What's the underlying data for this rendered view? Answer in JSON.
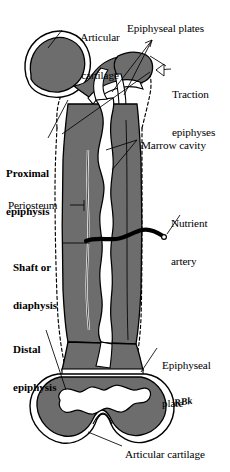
{
  "figure": {
    "signature": "RBk",
    "colors": {
      "bone_fill": "#6e6e6e",
      "cortex_gray": "#6d6d6d",
      "marrow_white": "#ffffff",
      "outline_black": "#000000",
      "periosteum_dashed": "#000000",
      "background": "#ffffff",
      "artery_black": "#000000"
    }
  },
  "labels": {
    "articular_cartilage_top": {
      "line1": "Articular",
      "line2": "cartilage"
    },
    "epiphyseal_plates": {
      "text": "Epiphyseal plates"
    },
    "traction_epiphyses": {
      "line1": "Traction",
      "line2": "epiphyses"
    },
    "proximal_epiphysis": {
      "line1": "Proximal",
      "line2": "epiphysis"
    },
    "marrow_cavity": {
      "text": "Marrow cavity"
    },
    "periosteum": {
      "text": "Periosteum"
    },
    "nutrient_artery": {
      "line1": "Nutrient",
      "line2": "artery"
    },
    "shaft_or_diaphysis": {
      "line1": "Shaft or",
      "line2": "diaphysis"
    },
    "distal_epiphysis": {
      "line1": "Distal",
      "line2": "epiphysis"
    },
    "epiphyseal_plate": {
      "line1": "Epiphyseal",
      "line2": "plate"
    },
    "articular_cartilage_bottom": {
      "text": "Articular cartilage"
    }
  }
}
